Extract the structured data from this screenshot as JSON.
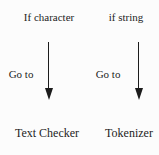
{
  "diagram": {
    "branches": [
      {
        "condition": "If character",
        "action": "Go to",
        "target": "Text Checker"
      },
      {
        "condition": "if string",
        "action": "Go to",
        "target": "Tokenizer"
      }
    ],
    "colors": {
      "background": "#fcfcfc",
      "ink": "#1c1c1c"
    }
  }
}
